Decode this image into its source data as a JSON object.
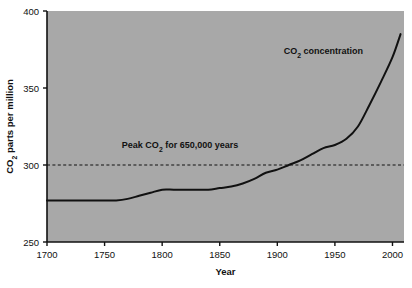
{
  "chart_data": {
    "type": "line",
    "title": "",
    "subtitle": "",
    "xlabel": "Year",
    "ylabel": "CO2 parts per million",
    "ylabel_parts": {
      "pre": "CO",
      "sub": "2",
      "post": " parts per million"
    },
    "xlim": [
      1700,
      2010
    ],
    "ylim": [
      250,
      400
    ],
    "xticks": [
      1700,
      1750,
      1800,
      1850,
      1900,
      1950,
      2000
    ],
    "xtick_labels": [
      "1700",
      "1750",
      "1800",
      "1850",
      "1900",
      "1950",
      "2000"
    ],
    "yticks": [
      250,
      300,
      350,
      400
    ],
    "ytick_labels": [
      "250",
      "300",
      "350",
      "400"
    ],
    "grid": false,
    "legend": "none",
    "plot_background": "#a8a8a8",
    "figure_background": "#ffffff",
    "line_color": "#111111",
    "line_width": 2.0,
    "series": [
      {
        "name": "CO2 concentration",
        "x": [
          1700,
          1710,
          1720,
          1730,
          1740,
          1750,
          1760,
          1770,
          1780,
          1790,
          1800,
          1810,
          1820,
          1830,
          1840,
          1850,
          1860,
          1870,
          1880,
          1890,
          1900,
          1910,
          1920,
          1930,
          1940,
          1950,
          1960,
          1970,
          1980,
          1990,
          2000,
          2007
        ],
        "values": [
          277,
          277,
          277,
          277,
          277,
          277,
          277,
          278,
          280,
          282,
          284,
          284,
          284,
          284,
          284,
          285,
          286,
          288,
          291,
          295,
          297,
          300,
          303,
          307,
          311,
          313,
          317,
          325,
          339,
          354,
          370,
          385
        ]
      }
    ],
    "reference_lines": [
      {
        "name": "peak-co2-threshold",
        "orientation": "horizontal",
        "value": 300,
        "style": "dashed",
        "color": "#111111",
        "label": "Peak CO2 for 650,000 years",
        "label_parts": {
          "pre": "Peak CO",
          "sub": "2",
          "post": " for 650,000 years"
        },
        "label_x": 1765,
        "label_y": 311
      }
    ],
    "annotations": [
      {
        "name": "co2-concentration-label",
        "text": "CO2 concentration",
        "text_parts": {
          "pre": "CO",
          "sub": "2",
          "post": " concentration"
        },
        "x": 1940,
        "y": 372
      }
    ]
  }
}
